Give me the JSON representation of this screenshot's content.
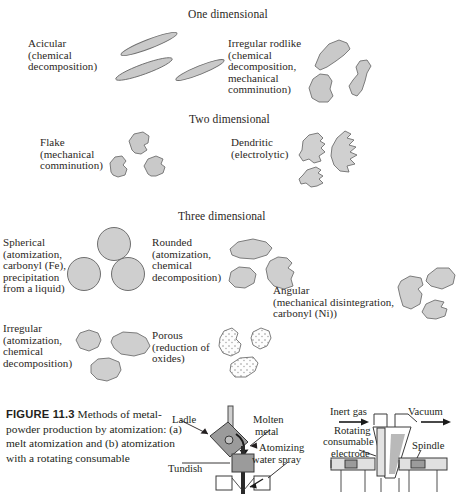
{
  "figure": {
    "headings": [
      {
        "text": "One dimensional",
        "x": 188,
        "y": 8
      },
      {
        "text": "Two dimensional",
        "x": 189,
        "y": 113
      },
      {
        "text": "Three dimensional",
        "x": 178,
        "y": 210
      }
    ],
    "groups": [
      {
        "id": "acicular",
        "label_lines": [
          "Acicular",
          "(chemical",
          "decomposition)"
        ],
        "label_x": 28,
        "label_y": 38,
        "shape_kind": "needle",
        "shapes_x": 108,
        "shapes_y": 32
      },
      {
        "id": "irregular-rodlike",
        "label_lines": [
          "Irregular rodlike",
          "(chemical",
          "decomposition,",
          "mechanical",
          "comminution)"
        ],
        "label_x": 228,
        "label_y": 38,
        "shape_kind": "rodlike",
        "shapes_x": 305,
        "shapes_y": 38
      },
      {
        "id": "flake",
        "label_lines": [
          "Flake",
          "(mechanical",
          "comminution)"
        ],
        "label_x": 40,
        "label_y": 137,
        "shape_kind": "flake",
        "shapes_x": 110,
        "shapes_y": 131
      },
      {
        "id": "dendritic",
        "label_lines": [
          "Dendritic",
          "(electrolytic)"
        ],
        "label_x": 231,
        "label_y": 137,
        "shape_kind": "dendritic",
        "shapes_x": 292,
        "shapes_y": 126
      },
      {
        "id": "spherical",
        "label_lines": [
          "Spherical",
          "(atomization,",
          "carbonyl (Fe),",
          "precipitation",
          "from a liquid)"
        ],
        "label_x": 3,
        "label_y": 237,
        "shape_kind": "spheres",
        "shapes_x": 66,
        "shapes_y": 226
      },
      {
        "id": "rounded",
        "label_lines": [
          "Rounded",
          "(atomization,",
          "chemical",
          "decomposition)"
        ],
        "label_x": 152,
        "label_y": 237,
        "shape_kind": "rounded",
        "shapes_x": 228,
        "shapes_y": 237
      },
      {
        "id": "angular",
        "label_lines": [
          "Angular",
          "(mechanical disintegration,",
          "carbonyl (Ni))"
        ],
        "label_x": 273,
        "label_y": 285,
        "shape_kind": "angular",
        "shapes_x": 393,
        "shapes_y": 263
      },
      {
        "id": "irregular",
        "label_lines": [
          "Irregular",
          "(atomization,",
          "chemical",
          "decomposition)"
        ],
        "label_x": 3,
        "label_y": 323,
        "shape_kind": "irregular",
        "shapes_x": 72,
        "shapes_y": 328
      },
      {
        "id": "porous",
        "label_lines": [
          "Porous",
          "(reduction of",
          "oxides)"
        ],
        "label_x": 152,
        "label_y": 330,
        "shape_kind": "porous",
        "shapes_x": 215,
        "shapes_y": 327
      }
    ]
  },
  "caption": {
    "number_label": "FIGURE  11.3",
    "text": "  Methods of metal-powder production by atomization: (a) melt atomization and (b) atomization with a rotating consumable"
  },
  "diagram_a": {
    "labels": [
      {
        "text": "Ladle",
        "x": 172,
        "y": 414
      },
      {
        "text": "Tundish",
        "x": 168,
        "y": 463
      },
      {
        "text": "Molten",
        "x": 253,
        "y": 414
      },
      {
        "text": "metal",
        "x": 255,
        "y": 426
      },
      {
        "text": "Atomizing",
        "x": 259,
        "y": 442
      },
      {
        "text": "water spray",
        "x": 252,
        "y": 454
      }
    ]
  },
  "diagram_b": {
    "labels": [
      {
        "text": "Inert gas",
        "x": 330,
        "y": 406
      },
      {
        "text": "Vacuum",
        "x": 408,
        "y": 406
      },
      {
        "text": "Rotating",
        "x": 334,
        "y": 425
      },
      {
        "text": "consumable",
        "x": 323,
        "y": 436
      },
      {
        "text": "electrode",
        "x": 331,
        "y": 448
      },
      {
        "text": "Spindle",
        "x": 412,
        "y": 440
      }
    ]
  },
  "colors": {
    "particle_fill": "#c9c9c9",
    "particle_stroke": "#6f6f6f",
    "porous_fill": "#fdfdfd",
    "text": "#231f20",
    "diagram_fill": "#9b9b9b"
  }
}
